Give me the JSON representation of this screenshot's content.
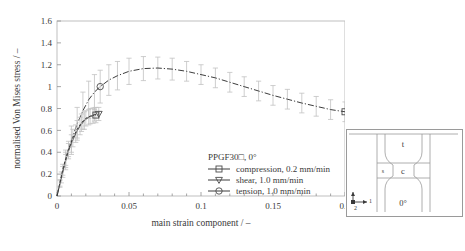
{
  "chart_data": {
    "type": "line",
    "title": "",
    "xlabel": "main strain component / –",
    "ylabel": "normalised Von Mises stress / –",
    "xlim": [
      0,
      0.2
    ],
    "ylim": [
      0,
      1.6
    ],
    "xticks": [
      "0",
      "0.05",
      "0.1",
      "0.15",
      "0.2"
    ],
    "xtick_values": [
      0,
      0.05,
      0.1,
      0.15,
      0.2
    ],
    "yticks": [
      "0",
      "0.2",
      "0.4",
      "0.6",
      "0.8",
      "1",
      "1.2",
      "1.4",
      "1.6"
    ],
    "ytick_values": [
      0,
      0.2,
      0.4,
      0.6,
      0.8,
      1.0,
      1.2,
      1.4,
      1.6
    ],
    "grid": false,
    "legend_position": "lower-center",
    "series": [
      {
        "name": "compression, 0.2 mm/min",
        "marker": "square",
        "linestyle": "solid",
        "x": [
          0.0,
          0.002,
          0.004,
          0.006,
          0.008,
          0.01,
          0.013,
          0.016,
          0.019,
          0.022,
          0.025,
          0.027
        ],
        "y": [
          0.0,
          0.11,
          0.22,
          0.32,
          0.41,
          0.48,
          0.57,
          0.64,
          0.69,
          0.72,
          0.735,
          0.74
        ],
        "yerr": [
          0.0,
          0.03,
          0.05,
          0.06,
          0.07,
          0.08,
          0.08,
          0.08,
          0.08,
          0.07,
          0.07,
          0.07
        ]
      },
      {
        "name": "shear, 1.0 mm/min",
        "marker": "triangle-down",
        "linestyle": "dashed",
        "x": [
          0.0,
          0.002,
          0.004,
          0.006,
          0.008,
          0.011,
          0.014,
          0.017,
          0.02,
          0.023,
          0.026,
          0.029
        ],
        "y": [
          0.0,
          0.12,
          0.24,
          0.34,
          0.43,
          0.53,
          0.61,
          0.67,
          0.71,
          0.73,
          0.745,
          0.75
        ],
        "yerr": [
          0.0,
          0.03,
          0.05,
          0.06,
          0.07,
          0.08,
          0.08,
          0.08,
          0.07,
          0.07,
          0.06,
          0.06
        ]
      },
      {
        "name": "tension, 1.0 mm/min",
        "marker": "circle",
        "linestyle": "dash-dot",
        "x": [
          0.0,
          0.003,
          0.006,
          0.01,
          0.014,
          0.018,
          0.022,
          0.026,
          0.03,
          0.036,
          0.042,
          0.05,
          0.06,
          0.07,
          0.08,
          0.09,
          0.1,
          0.11,
          0.12,
          0.13,
          0.14,
          0.15,
          0.16,
          0.17,
          0.18,
          0.19,
          0.2
        ],
        "y": [
          0.0,
          0.17,
          0.33,
          0.51,
          0.66,
          0.78,
          0.88,
          0.95,
          1.0,
          1.06,
          1.1,
          1.14,
          1.165,
          1.17,
          1.16,
          1.14,
          1.11,
          1.08,
          1.04,
          1.0,
          0.96,
          0.92,
          0.885,
          0.85,
          0.82,
          0.79,
          0.77
        ],
        "yerr": [
          0.0,
          0.05,
          0.09,
          0.13,
          0.15,
          0.17,
          0.17,
          0.16,
          0.15,
          0.14,
          0.13,
          0.12,
          0.11,
          0.1,
          0.1,
          0.09,
          0.09,
          0.09,
          0.09,
          0.09,
          0.09,
          0.09,
          0.09,
          0.09,
          0.09,
          0.09,
          0.09
        ]
      }
    ]
  },
  "legend": {
    "title": "PPGF30□, 0°",
    "entries": [
      {
        "label": "compression, 0.2 mm/min"
      },
      {
        "label": "shear, 1.0 mm/min"
      },
      {
        "label": "tension, 1.0 mm/min"
      }
    ]
  },
  "inset": {
    "label_top": "t",
    "label_center": "c",
    "label_left": "s",
    "label_bottom": "0°",
    "axis_1": "1",
    "axis_2": "2"
  },
  "colors": {
    "line": "#3d3d3d",
    "errorbar": "#c2c2c2",
    "frame": "#b9b9b9",
    "text": "#3a3a3a"
  }
}
